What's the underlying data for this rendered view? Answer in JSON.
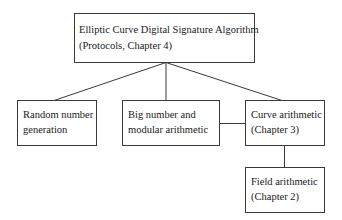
{
  "diagram": {
    "type": "hierarchy",
    "nodes": [
      {
        "id": "ecdsa",
        "lines": [
          "Elliptic Curve Digital Signature Algorithm",
          "(Protocols, Chapter 4)"
        ]
      },
      {
        "id": "random",
        "lines": [
          "Random number",
          "generation"
        ]
      },
      {
        "id": "bignum",
        "lines": [
          "Big number and",
          "modular arithmetic"
        ]
      },
      {
        "id": "curve",
        "lines": [
          "Curve arithmetic",
          "(Chapter 3)"
        ]
      },
      {
        "id": "field",
        "lines": [
          "Field arithmetic",
          "(Chapter 2)"
        ]
      }
    ],
    "edges": [
      {
        "from": "ecdsa",
        "to": "random"
      },
      {
        "from": "ecdsa",
        "to": "bignum"
      },
      {
        "from": "ecdsa",
        "to": "curve"
      },
      {
        "from": "bignum",
        "to": "curve"
      },
      {
        "from": "curve",
        "to": "field"
      }
    ],
    "colors": {
      "stroke": "#3a3a3a",
      "background": "#ffffff",
      "text": "#1a1a1a"
    }
  }
}
